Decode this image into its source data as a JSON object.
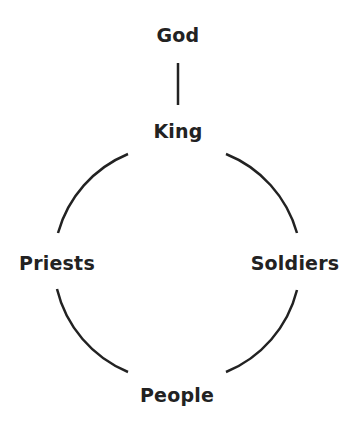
{
  "diagram": {
    "nodes": [
      {
        "id": "god",
        "label": "God"
      },
      {
        "id": "king",
        "label": "King"
      },
      {
        "id": "priests",
        "label": "Priests"
      },
      {
        "id": "soldiers",
        "label": "Soldiers"
      },
      {
        "id": "people",
        "label": "People"
      }
    ],
    "edges": [
      {
        "from": "god",
        "to": "king",
        "shape": "line"
      },
      {
        "from": "king",
        "to": "priests",
        "shape": "arc"
      },
      {
        "from": "king",
        "to": "soldiers",
        "shape": "arc"
      },
      {
        "from": "priests",
        "to": "people",
        "shape": "arc"
      },
      {
        "from": "soldiers",
        "to": "people",
        "shape": "arc"
      }
    ],
    "colors": {
      "stroke": "#222222",
      "text": "#222222",
      "background": "#ffffff"
    }
  }
}
